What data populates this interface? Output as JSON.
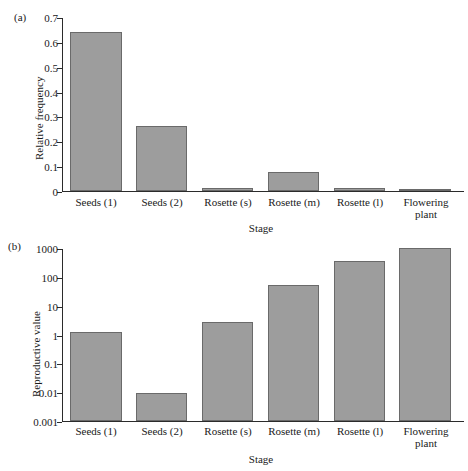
{
  "figure": {
    "background": "#ffffff",
    "bar_fill": "#9d9d9d",
    "bar_stroke": "#6a6a6a",
    "axis_color": "#2b2b2b"
  },
  "panels": {
    "a": {
      "label": "(a)"
    },
    "b": {
      "label": "(b)"
    }
  },
  "chart_data": [
    {
      "type": "bar",
      "panel": "(a)",
      "title": "",
      "xlabel": "Stage",
      "ylabel": "Relative frequency",
      "categories": [
        "Seeds (1)",
        "Seeds (2)",
        "Rosette (s)",
        "Rosette (m)",
        "Rosette (l)",
        "Flowering plant"
      ],
      "values": [
        0.645,
        0.265,
        0.012,
        0.075,
        0.013,
        0.005
      ],
      "yscale": "linear",
      "ylim": [
        0,
        0.7
      ],
      "yticks": [
        0,
        0.1,
        0.2,
        0.3,
        0.4,
        0.5,
        0.6,
        0.7
      ],
      "ytick_labels": [
        "0",
        "0.1",
        "0.2",
        "0.3",
        "0.4",
        "0.5",
        "0.6",
        "0.7"
      ],
      "grid": false,
      "legend": "none"
    },
    {
      "type": "bar",
      "panel": "(b)",
      "title": "",
      "xlabel": "Stage",
      "ylabel": "Reproductive value",
      "categories": [
        "Seeds (1)",
        "Seeds (2)",
        "Rosette (s)",
        "Rosette (m)",
        "Rosette (l)",
        "Flowering plant"
      ],
      "values": [
        1.3,
        0.0095,
        2.8,
        55,
        380,
        1050
      ],
      "yscale": "log",
      "ylim": [
        0.001,
        1000
      ],
      "yticks": [
        0.001,
        0.01,
        0.1,
        1,
        10,
        100,
        1000
      ],
      "ytick_labels": [
        "0.001",
        "0.01",
        "0.1",
        "1",
        "10",
        "100",
        "1000"
      ],
      "grid": false,
      "legend": "none"
    }
  ]
}
